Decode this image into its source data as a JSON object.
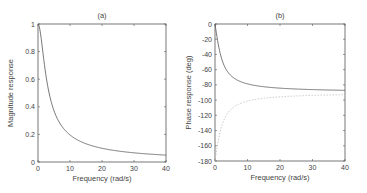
{
  "chart_data": [
    {
      "type": "line",
      "title": "(a)",
      "xlabel": "Frequency (rad/s)",
      "ylabel": "Magnitude response",
      "xlim": [
        0,
        40
      ],
      "ylim": [
        0,
        1
      ],
      "xticks": [
        0,
        10,
        20,
        30,
        40
      ],
      "yticks": [
        0,
        0.2,
        0.4,
        0.6,
        0.8,
        1
      ],
      "ytick_labels": [
        "0",
        "0.2",
        "0.4",
        "0.6",
        "0.8",
        "1"
      ],
      "grid": false,
      "series": [
        {
          "name": "magnitude",
          "style": "solid",
          "x": [
            0,
            1,
            2,
            3,
            4,
            5,
            6,
            8,
            10,
            15,
            20,
            25,
            30,
            35,
            40
          ],
          "values": [
            1.0,
            0.894,
            0.707,
            0.555,
            0.447,
            0.371,
            0.316,
            0.243,
            0.196,
            0.132,
            0.1,
            0.08,
            0.066,
            0.057,
            0.05
          ]
        }
      ]
    },
    {
      "type": "line",
      "title": "(b)",
      "xlabel": "Frequency (rad/s)",
      "ylabel": "Phase response (deg)",
      "xlim": [
        0,
        40
      ],
      "ylim": [
        -180,
        0
      ],
      "xticks": [
        0,
        10,
        20,
        30,
        40
      ],
      "yticks": [
        0,
        -20,
        -40,
        -60,
        -80,
        -100,
        -120,
        -140,
        -160,
        -180
      ],
      "ytick_labels": [
        "0",
        "-20",
        "-40",
        "-60",
        "-80",
        "-100",
        "-120",
        "-140",
        "-160",
        "-180"
      ],
      "grid": false,
      "series": [
        {
          "name": "phase-solid",
          "style": "solid",
          "x": [
            0,
            1,
            2,
            3,
            4,
            5,
            6,
            8,
            10,
            15,
            20,
            25,
            30,
            35,
            40
          ],
          "values": [
            0,
            -26.6,
            -45,
            -56.3,
            -63.4,
            -68.2,
            -71.6,
            -76,
            -78.7,
            -82.4,
            -84.3,
            -85.4,
            -86.2,
            -86.7,
            -87.1
          ]
        },
        {
          "name": "phase-dashed",
          "style": "dashed",
          "x": [
            0,
            1,
            2,
            3,
            4,
            5,
            6,
            8,
            10,
            15,
            20,
            25,
            30,
            35,
            40
          ],
          "values": [
            -180,
            -153.4,
            -135,
            -123.7,
            -116.6,
            -111.8,
            -108.4,
            -104,
            -101.3,
            -97.6,
            -95.7,
            -94.6,
            -93.8,
            -93.3,
            -92.9
          ]
        }
      ]
    }
  ],
  "plots": {
    "a": {
      "title": "(a)",
      "xlabel": "Frequency (rad/s)",
      "ylabel": "Magnitude response"
    },
    "b": {
      "title": "(b)",
      "xlabel": "Frequency (rad/s)",
      "ylabel": "Phase response (deg)"
    }
  },
  "colors": {
    "axis": "#555555",
    "solid_line": "#555555",
    "dashed_line": "#bbbbbb"
  }
}
